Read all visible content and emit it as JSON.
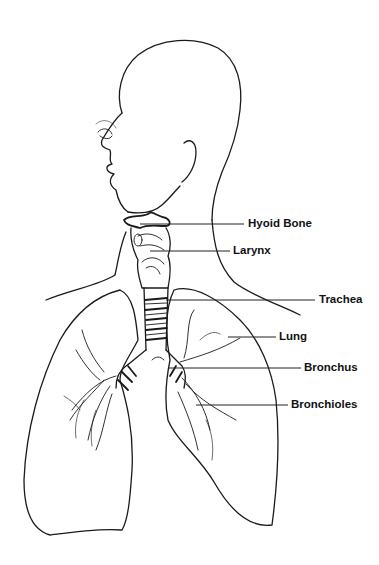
{
  "diagram": {
    "labels": [
      {
        "id": "hyoid-bone",
        "text": "Hyoid Bone",
        "x": 248,
        "y": 219
      },
      {
        "id": "larynx",
        "text": "Larynx",
        "x": 233,
        "y": 246
      },
      {
        "id": "trachea",
        "text": "Trachea",
        "x": 319,
        "y": 294
      },
      {
        "id": "lung",
        "text": "Lung",
        "x": 279,
        "y": 331
      },
      {
        "id": "bronchus",
        "text": "Bronchus",
        "x": 304,
        "y": 362
      },
      {
        "id": "bronchioles",
        "text": "Bronchioles",
        "x": 291,
        "y": 399
      }
    ],
    "colors": {
      "line": "#1a1a1a",
      "background": "#ffffff",
      "label": "#111111"
    }
  }
}
